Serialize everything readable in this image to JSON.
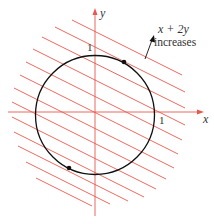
{
  "diagram": {
    "title": "",
    "axes": {
      "x_label": "x",
      "y_label": "y",
      "x_tick": "1",
      "y_tick": "1"
    },
    "annotation": {
      "line1": "x + 2y",
      "line2": "increases"
    },
    "colors": {
      "lines": "#e8584e",
      "circle": "#111111",
      "text": "#333333"
    },
    "circle": {
      "equation": "x^2 + y^2 = 1"
    },
    "level_lines": {
      "family": "x + 2y = c",
      "count": 13
    },
    "marked_points": [
      {
        "label": "max",
        "x": 0.447,
        "y": 0.894
      },
      {
        "label": "min",
        "x": -0.447,
        "y": -0.894
      }
    ]
  }
}
